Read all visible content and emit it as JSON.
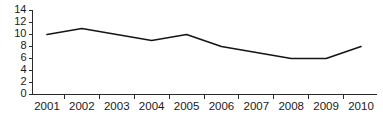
{
  "chart_data": {
    "type": "line",
    "title": "",
    "subtitle": "",
    "xlabel": "",
    "ylabel": "",
    "categories": [
      "2001",
      "2002",
      "2003",
      "2004",
      "2005",
      "2006",
      "2007",
      "2008",
      "2009",
      "2010"
    ],
    "values": [
      10,
      11,
      10,
      9,
      10,
      8,
      7,
      6,
      6,
      8
    ],
    "series": [
      {
        "name": "",
        "values": [
          10,
          11,
          10,
          9,
          10,
          8,
          7,
          6,
          6,
          8
        ]
      }
    ],
    "ylim": [
      0,
      14
    ],
    "ytick_labels": [
      "0",
      "2",
      "4",
      "6",
      "8",
      "10",
      "12",
      "14"
    ],
    "ytick_values": [
      0,
      2,
      4,
      6,
      8,
      10,
      12,
      14
    ],
    "xtick_labels": [
      "2001",
      "2002",
      "2003",
      "2004",
      "2005",
      "2006",
      "2007",
      "2008",
      "2009",
      "2010"
    ],
    "grid": false,
    "legend": false,
    "legend_position": "none",
    "line_color": "#151515",
    "axis_color": "#2b2b2b",
    "background_color": "#ffffff",
    "annotations": []
  }
}
